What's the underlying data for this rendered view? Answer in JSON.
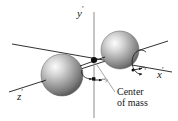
{
  "figure": {
    "background_color": "#ffffff",
    "line_color": "#1a1a1a",
    "sphere_light": "#f2f2f2",
    "sphere_mid": "#9a9a9a",
    "sphere_dark": "#4a4a4a"
  },
  "labels": {
    "y_axis": "y",
    "y_prime": "′",
    "x_axis": "x",
    "x_prime": "′",
    "z_axis": "z",
    "z_prime": "′",
    "omega_y": "ω",
    "omega_y_sub": "y′",
    "omega_x": "ω",
    "omega_x_sub": "x′",
    "center_line1": "Center",
    "center_line2": "of mass"
  },
  "elements": {
    "origin_dot": "center-of-mass-point",
    "sphere_left": "mass-sphere-left",
    "sphere_right": "mass-sphere-right",
    "rotation_arc_y": "omega-y-rotation-arc",
    "rotation_arc_x": "omega-x-rotation-arc",
    "leader_line": "center-of-mass-leader-line"
  },
  "geometry": {
    "origin_x": 94,
    "origin_y": 60,
    "sphere_left_cx": 62,
    "sphere_left_cy": 75,
    "sphere_left_r": 21,
    "sphere_right_cx": 120,
    "sphere_right_cy": 50,
    "sphere_right_r": 19
  }
}
